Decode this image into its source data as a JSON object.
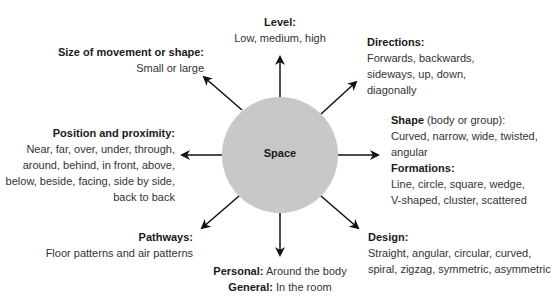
{
  "diagram": {
    "center": "Space",
    "colors": {
      "circle": "#c8c8c8",
      "arrow": "#111111",
      "text": "#333333"
    },
    "nodes": {
      "level": {
        "title": "Level:",
        "lines": [
          "Low, medium, high"
        ]
      },
      "directions": {
        "title": "Directions:",
        "lines": [
          "Forwards, backwards,",
          "sideways, up, down,",
          "diagonally"
        ]
      },
      "shape": {
        "title": "Shape",
        "title_suffix": " (body or group):",
        "lines": [
          "Curved, narrow, wide, twisted,",
          "angular"
        ]
      },
      "formations": {
        "title": "Formations:",
        "lines": [
          "Line, circle, square, wedge,",
          "V-shaped, cluster, scattered"
        ]
      },
      "design": {
        "title": "Design:",
        "lines": [
          "Straight, angular, circular, curved,",
          "spiral, zigzag, symmetric, asymmetric"
        ]
      },
      "personal": {
        "title": "Personal:",
        "text": " Around the body"
      },
      "general": {
        "title": "General:",
        "text": " In the room"
      },
      "pathways": {
        "title": "Pathways:",
        "lines": [
          "Floor patterns and air patterns"
        ]
      },
      "position": {
        "title": "Position and proximity:",
        "lines": [
          "Near, far, over, under, through,",
          "around, behind, in front, above,",
          "below, beside, facing, side by side,",
          "back to back"
        ]
      },
      "size": {
        "title": "Size of movement or shape:",
        "lines": [
          "Small or large"
        ]
      }
    }
  }
}
